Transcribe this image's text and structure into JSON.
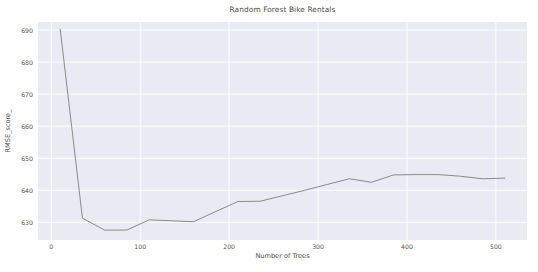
{
  "chart_data": {
    "type": "line",
    "title": "Random Forest Bike Rentals",
    "xlabel": "Number of Trees",
    "ylabel": "RMSE_score_",
    "xlim": [
      -15,
      535
    ],
    "ylim": [
      624.5,
      692.5
    ],
    "xticks": [
      0,
      100,
      200,
      300,
      400,
      500
    ],
    "xticklabels": [
      "0",
      "100",
      "200",
      "300",
      "400",
      "500"
    ],
    "yticks": [
      630,
      640,
      650,
      660,
      670,
      680,
      690
    ],
    "yticklabels": [
      "630",
      "640",
      "650",
      "660",
      "670",
      "680",
      "690"
    ],
    "grid": true,
    "legend": null,
    "series": [
      {
        "name": "RMSE_score_",
        "color": "#7f7f7f",
        "linewidth": 0.9,
        "x": [
          10,
          35,
          60,
          85,
          110,
          135,
          160,
          185,
          210,
          235,
          260,
          285,
          310,
          335,
          360,
          385,
          410,
          435,
          460,
          485,
          510
        ],
        "values": [
          690.2,
          631.3,
          627.6,
          627.6,
          630.8,
          630.5,
          630.2,
          633.4,
          636.5,
          636.6,
          638.3,
          640.0,
          641.8,
          643.6,
          642.5,
          644.8,
          644.9,
          644.9,
          644.4,
          643.6,
          643.8
        ]
      }
    ]
  },
  "figure": {
    "background_color": "#ffffff",
    "axes_background_color": "#eaeaf2",
    "grid_color": "#ffffff",
    "text_color": "#555555"
  }
}
